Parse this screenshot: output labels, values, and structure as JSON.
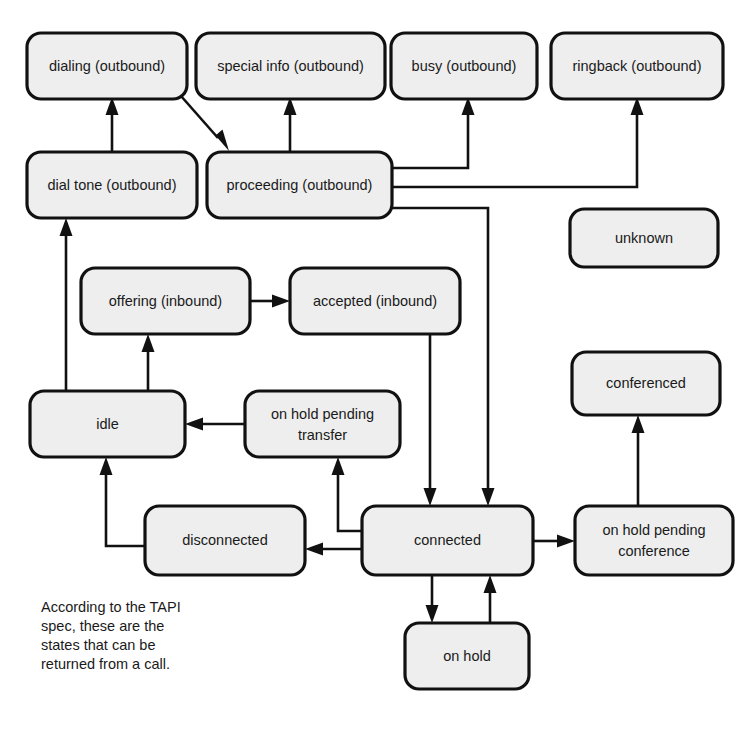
{
  "diagram": {
    "caption_lines": [
      "According to the TAPI",
      "spec, these are the",
      "states that can be",
      "returned from a call."
    ],
    "style": {
      "node_fill": "#eeeeee",
      "node_stroke": "#111111",
      "edge_stroke": "#111111",
      "background": "#ffffff",
      "text_color": "#1a1a1a"
    },
    "nodes": [
      {
        "id": "dialing",
        "label": "dialing (outbound)",
        "x": 27,
        "y": 33,
        "w": 160,
        "h": 66
      },
      {
        "id": "special_info",
        "label": "special info (outbound)",
        "x": 196,
        "y": 33,
        "w": 189,
        "h": 66
      },
      {
        "id": "busy",
        "label": "busy (outbound)",
        "x": 391,
        "y": 33,
        "w": 146,
        "h": 66
      },
      {
        "id": "ringback",
        "label": "ringback (outbound)",
        "x": 551,
        "y": 33,
        "w": 172,
        "h": 66
      },
      {
        "id": "dial_tone",
        "label": "dial tone (outbound)",
        "x": 27,
        "y": 152,
        "w": 170,
        "h": 66
      },
      {
        "id": "proceeding",
        "label": "proceeding (outbound)",
        "x": 207,
        "y": 152,
        "w": 185,
        "h": 66
      },
      {
        "id": "unknown",
        "label": "unknown",
        "x": 570,
        "y": 209,
        "w": 148,
        "h": 58
      },
      {
        "id": "offering",
        "label": "offering (inbound)",
        "x": 81,
        "y": 268,
        "w": 169,
        "h": 66
      },
      {
        "id": "accepted",
        "label": "accepted (inbound)",
        "x": 290,
        "y": 268,
        "w": 170,
        "h": 66
      },
      {
        "id": "conferenced",
        "label": "conferenced",
        "x": 572,
        "y": 352,
        "w": 148,
        "h": 63
      },
      {
        "id": "idle",
        "label": "idle",
        "x": 30,
        "y": 391,
        "w": 155,
        "h": 66
      },
      {
        "id": "on_hold_pending_transfer",
        "label": "on hold pending\ntransfer",
        "x": 245,
        "y": 391,
        "w": 155,
        "h": 66
      },
      {
        "id": "disconnected",
        "label": "disconnected",
        "x": 145,
        "y": 506,
        "w": 160,
        "h": 69
      },
      {
        "id": "connected",
        "label": "connected",
        "x": 362,
        "y": 506,
        "w": 171,
        "h": 69
      },
      {
        "id": "on_hold_pending_conference",
        "label": "on hold pending\nconference",
        "x": 575,
        "y": 506,
        "w": 158,
        "h": 69
      },
      {
        "id": "on_hold",
        "label": "on hold",
        "x": 405,
        "y": 623,
        "w": 124,
        "h": 66
      }
    ],
    "edges": [
      {
        "from": "dial_tone",
        "to": "dialing"
      },
      {
        "from": "dialing",
        "to": "proceeding"
      },
      {
        "from": "proceeding",
        "to": "special_info"
      },
      {
        "from": "proceeding",
        "to": "busy"
      },
      {
        "from": "proceeding",
        "to": "ringback"
      },
      {
        "from": "proceeding",
        "to": "connected"
      },
      {
        "from": "idle",
        "to": "dial_tone"
      },
      {
        "from": "idle",
        "to": "offering"
      },
      {
        "from": "offering",
        "to": "accepted"
      },
      {
        "from": "accepted",
        "to": "connected"
      },
      {
        "from": "on_hold_pending_transfer",
        "to": "idle"
      },
      {
        "from": "connected",
        "to": "on_hold_pending_transfer"
      },
      {
        "from": "connected",
        "to": "disconnected"
      },
      {
        "from": "disconnected",
        "to": "idle"
      },
      {
        "from": "connected",
        "to": "on_hold_pending_conference"
      },
      {
        "from": "on_hold_pending_conference",
        "to": "conferenced"
      },
      {
        "from": "connected",
        "to": "on_hold"
      },
      {
        "from": "on_hold",
        "to": "connected"
      }
    ]
  }
}
